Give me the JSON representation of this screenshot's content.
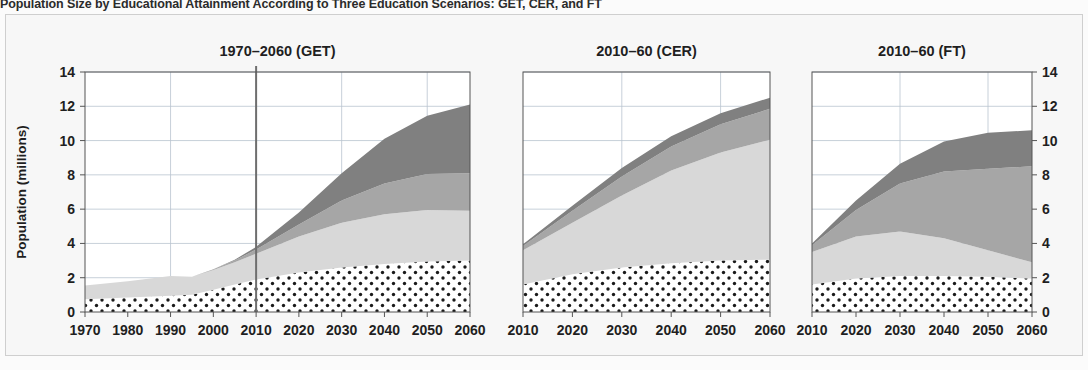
{
  "figure": {
    "title": "Population Size by Educational Attainment According to Three Education Scenarios: GET, CER, and FT",
    "background": "#f7f7f7",
    "frame_color": "#cfcfcf"
  },
  "axis": {
    "ylabel": "Population (millions)",
    "yticks": [
      "0",
      "2",
      "4",
      "6",
      "8",
      "10",
      "12",
      "14"
    ],
    "ylim": [
      0,
      14
    ]
  },
  "colors": {
    "layer_no_education": "#ffffff",
    "layer_primary": "#d8d8d8",
    "layer_secondary": "#a6a6a6",
    "layer_tertiary": "#808080",
    "dot_color": "#1a1a1a",
    "gridline": "#b9c4cf",
    "divider": "#6e6e6e",
    "axis": "#555555"
  },
  "chart_data": {
    "type": "area",
    "title": "Population Size by Educational Attainment According to Three Education Scenarios: GET, CER, and FT",
    "xlabel": "",
    "ylabel": "Population (millions)",
    "ylim": [
      0,
      14
    ],
    "grid": true,
    "legend_position": "none",
    "stacked": true,
    "panels": [
      {
        "id": "get",
        "title": "1970–2060 (GET)",
        "xlim": [
          1970,
          2060
        ],
        "xticks": [
          "1970",
          "1980",
          "1990",
          "2000",
          "2010",
          "2020",
          "2030",
          "2040",
          "2050",
          "2060"
        ],
        "x": [
          1970,
          1980,
          1990,
          1995,
          2000,
          2005,
          2010,
          2020,
          2030,
          2040,
          2050,
          2060
        ],
        "divider_year": 2010,
        "series": [
          {
            "name": "No education",
            "pattern": "dots",
            "values": [
              0.75,
              0.85,
              0.95,
              1.0,
              1.3,
              1.6,
              1.9,
              2.3,
              2.6,
              2.8,
              2.95,
              3.0
            ]
          },
          {
            "name": "Primary",
            "pattern": "light-gray",
            "values": [
              0.8,
              0.95,
              1.15,
              1.05,
              1.15,
              1.3,
              1.5,
              2.1,
              2.6,
              2.9,
              3.0,
              2.9
            ]
          },
          {
            "name": "Secondary",
            "pattern": "medium-gray",
            "values": [
              0.0,
              0.0,
              0.0,
              0.0,
              0.05,
              0.1,
              0.25,
              0.7,
              1.3,
              1.8,
              2.1,
              2.2
            ]
          },
          {
            "name": "Tertiary",
            "pattern": "dark-gray",
            "values": [
              0.0,
              0.0,
              0.0,
              0.0,
              0.0,
              0.05,
              0.15,
              0.7,
              1.6,
              2.6,
              3.4,
              4.0
            ]
          }
        ],
        "totals": [
          1.55,
          1.8,
          2.1,
          2.05,
          2.5,
          3.05,
          3.8,
          5.8,
          8.1,
          10.1,
          11.45,
          12.1
        ]
      },
      {
        "id": "cer",
        "title": "2010–60 (CER)",
        "xlim": [
          2010,
          2060
        ],
        "xticks": [
          "2010",
          "2020",
          "2030",
          "2040",
          "2050",
          "2060"
        ],
        "x": [
          2010,
          2020,
          2030,
          2040,
          2050,
          2060
        ],
        "divider_year": null,
        "series": [
          {
            "name": "No education",
            "pattern": "dots",
            "values": [
              1.6,
              2.2,
              2.6,
              2.85,
              3.0,
              3.05
            ]
          },
          {
            "name": "Primary",
            "pattern": "light-gray",
            "values": [
              2.0,
              3.0,
              4.2,
              5.4,
              6.3,
              7.0
            ]
          },
          {
            "name": "Secondary",
            "pattern": "medium-gray",
            "values": [
              0.25,
              0.7,
              1.1,
              1.4,
              1.65,
              1.8
            ]
          },
          {
            "name": "Tertiary",
            "pattern": "dark-gray",
            "values": [
              0.1,
              0.3,
              0.5,
              0.6,
              0.65,
              0.65
            ]
          }
        ],
        "totals": [
          3.95,
          6.2,
          8.4,
          10.25,
          11.6,
          12.5
        ]
      },
      {
        "id": "ft",
        "title": "2010–60 (FT)",
        "xlim": [
          2010,
          2060
        ],
        "xticks": [
          "2010",
          "2020",
          "2030",
          "2040",
          "2050",
          "2060"
        ],
        "x": [
          2010,
          2020,
          2030,
          2040,
          2050,
          2060
        ],
        "divider_year": null,
        "series": [
          {
            "name": "No education",
            "pattern": "dots",
            "values": [
              1.6,
              1.95,
              2.1,
              2.1,
              2.05,
              1.95
            ]
          },
          {
            "name": "Primary",
            "pattern": "light-gray",
            "values": [
              1.9,
              2.45,
              2.6,
              2.2,
              1.55,
              0.95
            ]
          },
          {
            "name": "Secondary",
            "pattern": "medium-gray",
            "values": [
              0.4,
              1.55,
              2.8,
              3.9,
              4.75,
              5.6
            ]
          },
          {
            "name": "Tertiary",
            "pattern": "dark-gray",
            "values": [
              0.1,
              0.55,
              1.15,
              1.75,
              2.1,
              2.1
            ]
          }
        ],
        "totals": [
          4.0,
          6.5,
          8.65,
          9.95,
          10.45,
          10.6
        ]
      }
    ]
  }
}
